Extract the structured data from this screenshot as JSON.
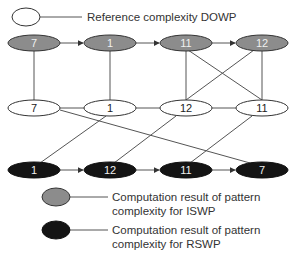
{
  "colors": {
    "iswp_fill": "#8c8c8c",
    "rswp_fill": "#141414",
    "dowp_fill": "#ffffff",
    "stroke": "#333333",
    "edge": "#555555",
    "node_text_light": "#f0f0f0",
    "node_text_dark": "#222222"
  },
  "legend": {
    "dowp": {
      "label": "Reference complexity DOWP"
    },
    "iswp": {
      "line1": "Computation result of pattern",
      "line2": "complexity for ISWP"
    },
    "rswp": {
      "line1": "Computation result of pattern",
      "line2": "complexity for RSWP"
    }
  },
  "rows": {
    "iswp": {
      "nodes": [
        "7",
        "1",
        "11",
        "12"
      ]
    },
    "dowp": {
      "nodes": [
        "7",
        "1",
        "12",
        "11"
      ]
    },
    "rswp": {
      "nodes": [
        "1",
        "12",
        "11",
        "7"
      ]
    }
  }
}
